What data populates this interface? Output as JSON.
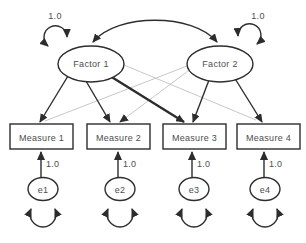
{
  "colors": {
    "line": "#2d2d2d",
    "faint": "#c8c8c8",
    "text": "#4e4e4e",
    "fill": "#ffffff",
    "bg": "#ffffff"
  },
  "factors": [
    {
      "label": "Factor 1",
      "variance": "1.0"
    },
    {
      "label": "Factor 2",
      "variance": "1.0"
    }
  ],
  "measures": [
    {
      "label": "Measure 1"
    },
    {
      "label": "Measure 2"
    },
    {
      "label": "Measure 3"
    },
    {
      "label": "Measure 4"
    }
  ],
  "errors": [
    {
      "label": "e1",
      "loading": "1.0"
    },
    {
      "label": "e2",
      "loading": "1.0"
    },
    {
      "label": "e3",
      "loading": "1.0"
    },
    {
      "label": "e4",
      "loading": "1.0"
    }
  ],
  "relations": {
    "covariance": {
      "from": "Factor 1",
      "to": "Factor 2",
      "style": "curved-double-headed-arrow"
    },
    "solid_loadings": [
      [
        "Factor 1",
        "Measure 1"
      ],
      [
        "Factor 1",
        "Measure 2"
      ],
      [
        "Factor 1",
        "Measure 3"
      ],
      [
        "Factor 2",
        "Measure 3"
      ],
      [
        "Factor 2",
        "Measure 4"
      ]
    ],
    "faint_loadings": [
      [
        "Factor 2",
        "Measure 1"
      ],
      [
        "Factor 2",
        "Measure 2"
      ],
      [
        "Factor 1",
        "Measure 4"
      ]
    ],
    "error_arrows": [
      [
        "e1",
        "Measure 1"
      ],
      [
        "e2",
        "Measure 2"
      ],
      [
        "e3",
        "Measure 3"
      ],
      [
        "e4",
        "Measure 4"
      ]
    ],
    "variance_loops": [
      "Factor 1",
      "Factor 2",
      "e1",
      "e2",
      "e3",
      "e4"
    ]
  }
}
